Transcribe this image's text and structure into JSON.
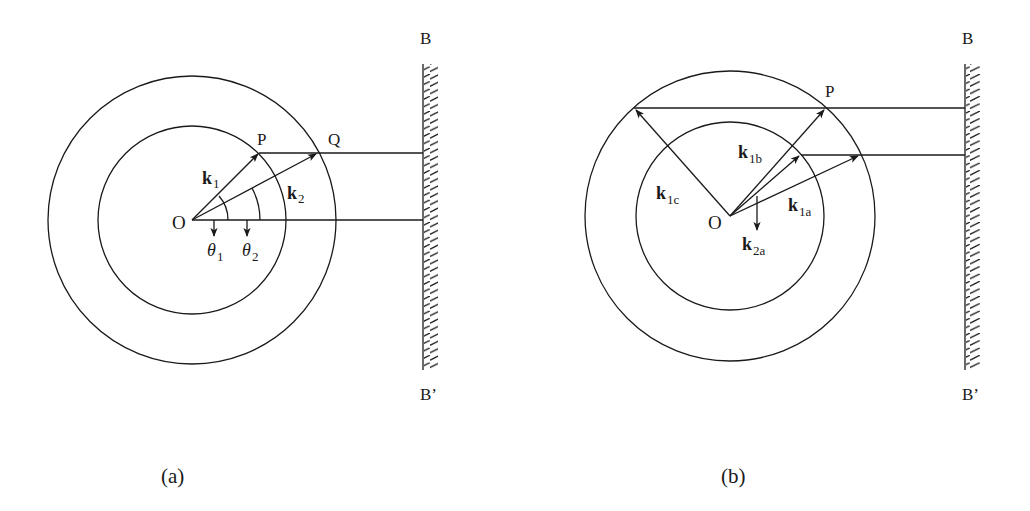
{
  "figure": {
    "panels": [
      {
        "caption": "(a)",
        "labels": {
          "origin": "O",
          "point_p": "P",
          "point_q": "Q",
          "mirror_top": "B",
          "mirror_bottom": "B’",
          "k1_main": "k",
          "k1_sub": "1",
          "k2_main": "k",
          "k2_sub": "2",
          "theta1_main": "θ",
          "theta1_sub": "1",
          "theta2_main": "θ",
          "theta2_sub": "2"
        }
      },
      {
        "caption": "(b)",
        "labels": {
          "origin": "O",
          "point_p": "P",
          "mirror_top": "B",
          "mirror_bottom": "B’",
          "k1b_main": "k",
          "k1b_sub": "1b",
          "k1c_main": "k",
          "k1c_sub": "1c",
          "k1a_main": "k",
          "k1a_sub": "1a",
          "k2a_main": "k",
          "k2a_sub": "2a"
        }
      }
    ],
    "colors": {
      "stroke": "#1a1a1a",
      "background": "#ffffff"
    }
  }
}
